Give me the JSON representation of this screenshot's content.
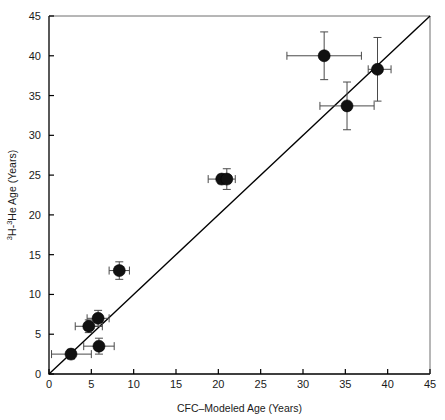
{
  "figure": {
    "background": "#ffffff",
    "width": 445,
    "height": 420
  },
  "chart_data": {
    "type": "scatter",
    "title": "",
    "xlabel": "CFC–Modeled Age (Years)",
    "ylabel_parts": {
      "sup1": "3",
      "mid1": "H-",
      "sup2": "3",
      "mid2": "He Age (Years)"
    },
    "ylabel": "3H-3He Age (Years)",
    "xlim": [
      0,
      45
    ],
    "ylim": [
      0,
      45
    ],
    "xticks": [
      0,
      5,
      10,
      15,
      20,
      25,
      30,
      35,
      40,
      45
    ],
    "yticks": [
      0,
      5,
      10,
      15,
      20,
      25,
      30,
      35,
      40,
      45
    ],
    "xticklabels": [
      "0",
      "5",
      "10",
      "15",
      "20",
      "25",
      "30",
      "35",
      "40",
      "45"
    ],
    "yticklabels": [
      "0",
      "5",
      "10",
      "15",
      "20",
      "25",
      "30",
      "35",
      "40",
      "45"
    ],
    "grid": false,
    "legend": null,
    "marker": {
      "shape": "circle",
      "color": "#111111",
      "radius_px": 6.0,
      "edge_color": "#000000"
    },
    "reference_line": {
      "name": "one-to-one line",
      "from": [
        0,
        0
      ],
      "to": [
        45,
        45
      ],
      "color": "#000000",
      "width_px": 1.4,
      "style": "solid"
    },
    "errorbar_style": {
      "color": "#4a4a4a",
      "width_px": 1.0,
      "cap_px": 4
    },
    "points": [
      {
        "x": 2.6,
        "y": 2.5,
        "xerr_low": 2.3,
        "xerr_high": 2.4,
        "yerr": 0.6
      },
      {
        "x": 4.7,
        "y": 6.0,
        "xerr_low": 1.6,
        "xerr_high": 1.6,
        "yerr": 0.8
      },
      {
        "x": 5.8,
        "y": 7.0,
        "xerr_low": 1.3,
        "xerr_high": 1.3,
        "yerr": 1.0
      },
      {
        "x": 5.9,
        "y": 3.5,
        "xerr_low": 1.8,
        "xerr_high": 1.8,
        "yerr": 1.0
      },
      {
        "x": 8.3,
        "y": 13.0,
        "xerr_low": 1.2,
        "xerr_high": 1.2,
        "yerr": 1.1
      },
      {
        "x": 20.4,
        "y": 24.5,
        "xerr_low": 1.6,
        "xerr_high": 1.1,
        "yerr": 0.6
      },
      {
        "x": 21.0,
        "y": 24.5,
        "xerr_low": 0.6,
        "xerr_high": 1.0,
        "yerr": 1.3
      },
      {
        "x": 32.5,
        "y": 40.0,
        "xerr_low": 4.4,
        "xerr_high": 4.4,
        "yerr": 3.0
      },
      {
        "x": 35.2,
        "y": 33.7,
        "xerr_low": 3.2,
        "xerr_high": 3.2,
        "yerr": 3.0
      },
      {
        "x": 38.8,
        "y": 38.3,
        "xerr_low": 1.1,
        "xerr_high": 1.6,
        "yerr": 4.0
      }
    ]
  }
}
